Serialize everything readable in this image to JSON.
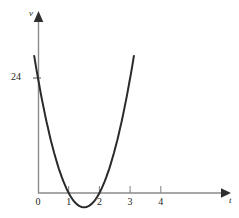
{
  "figure": {
    "background_color": "#ffffff",
    "width": 239,
    "height": 218
  },
  "axes": {
    "x_axis": {
      "name": "t",
      "label": "t",
      "arrow": "right-arrow-icon",
      "color": "#808080"
    },
    "y_axis": {
      "name": "v",
      "label": "v",
      "arrow": "up-arrow-icon",
      "color": "#808080"
    },
    "origin_label": "0"
  },
  "ticks": {
    "x": [
      {
        "label": "0",
        "value": 0
      },
      {
        "label": "1",
        "value": 1
      },
      {
        "label": "2",
        "value": 2
      },
      {
        "label": "3",
        "value": 3
      },
      {
        "label": "4",
        "value": 4
      }
    ],
    "y": [
      {
        "label": "24",
        "value": 24
      }
    ]
  },
  "curve": {
    "name": "velocity-curve",
    "color": "#2a2a2a",
    "stroke_width": 2
  },
  "chart_data": {
    "type": "line",
    "title": "",
    "subtitle": "",
    "xlabel": "t",
    "ylabel": "v",
    "grid": false,
    "legend": null,
    "xlim": [
      -0.25,
      6.15
    ],
    "ylim": [
      -6,
      33
    ],
    "xticks": [
      0,
      1,
      2,
      3,
      4
    ],
    "xticklabels": [
      "0",
      "1",
      "2",
      "3",
      "4"
    ],
    "yticks": [
      24
    ],
    "yticklabels": [
      "24"
    ],
    "annotations": [],
    "series": [
      {
        "name": "v(t)",
        "equation": "v = 3(t-2)(t-4) = 3t^2 - 18t + 24",
        "roots": [
          2,
          4
        ],
        "vertex": {
          "t": 3,
          "v": -3
        },
        "y_intercept": 24,
        "x": [
          0.0,
          0.2,
          0.4,
          0.6,
          0.8,
          1.0,
          1.2,
          1.4,
          1.6,
          1.8,
          2.0,
          2.2,
          2.4,
          2.6,
          2.8,
          3.0,
          3.2,
          3.4,
          3.6,
          3.8,
          4.0,
          4.2,
          4.4,
          4.6,
          4.8,
          5.0,
          5.2,
          5.4,
          5.6,
          5.8,
          6.0
        ],
        "y": [
          24.0,
          20.52,
          17.28,
          14.28,
          11.52,
          9.0,
          6.72,
          4.68,
          2.88,
          1.32,
          0.0,
          -1.08,
          -1.92,
          -2.52,
          -2.88,
          -3.0,
          -2.88,
          -2.52,
          -1.92,
          -1.08,
          0.0,
          1.32,
          2.88,
          4.68,
          6.72,
          9.0,
          11.52,
          14.28,
          17.28,
          20.52,
          24.0
        ]
      }
    ]
  }
}
